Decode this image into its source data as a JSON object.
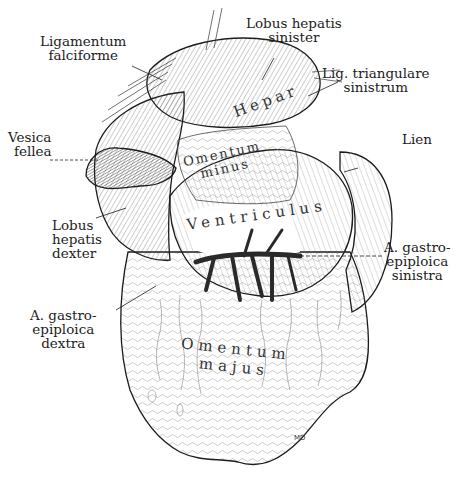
{
  "figure": {
    "type": "anatomical illustration",
    "colors": {
      "ink": "#1c1c1c",
      "background": "#ffffff",
      "vessel": "#2a2a2a"
    },
    "signature": "MD"
  },
  "labels": {
    "ligamentum_falciforme": [
      "Ligamentum",
      "falciforme"
    ],
    "lobus_hepatis_sinister": [
      "Lobus hepatis",
      "sinister"
    ],
    "lig_triangulare_sinistrum": [
      "Lig. triangulare",
      "sinistrum"
    ],
    "vesica_fellea": [
      "Vesica",
      "fellea"
    ],
    "lien": [
      "Lien"
    ],
    "lobus_hepatis_dexter": [
      "Lobus",
      "hepatis",
      "dexter"
    ],
    "a_gastroepiploica_sinistra": [
      "A. gastro-",
      "epiploica",
      "sinistra"
    ],
    "a_gastroepiploica_dextra": [
      "A. gastro-",
      "epiploica",
      "dextra"
    ]
  },
  "organ_labels": {
    "hepar": "Hepar",
    "omentum_minus": [
      "Omentum",
      "minus"
    ],
    "ventriculus": "Ventriculus",
    "omentum_majus": [
      "Omentum",
      "majus"
    ]
  }
}
